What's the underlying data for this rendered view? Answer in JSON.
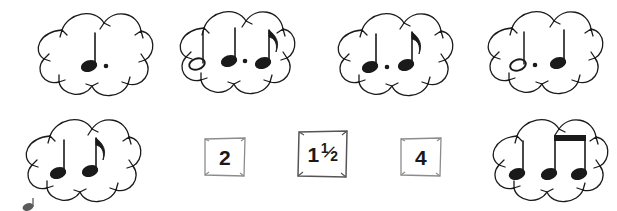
{
  "page": {
    "background_color": "#ffffff",
    "ink_color": "#1a1a1a",
    "box_border_color": "#8c8c8c"
  },
  "note_groups": [
    {
      "id": "group-1",
      "position": "top-row-1",
      "notes": [
        {
          "type": "quarter-note",
          "head": "filled",
          "stem": "up",
          "dotted": true,
          "flag": "none",
          "beamed": false
        }
      ],
      "note_count": 1,
      "beats": 1.5
    },
    {
      "id": "group-2",
      "position": "top-row-2",
      "notes": [
        {
          "type": "half-note",
          "head": "hollow",
          "stem": "up",
          "dotted": false,
          "flag": "none",
          "beamed": false
        },
        {
          "type": "quarter-note",
          "head": "filled",
          "stem": "up",
          "dotted": true,
          "flag": "none",
          "beamed": false
        },
        {
          "type": "eighth-note",
          "head": "filled",
          "stem": "up",
          "dotted": false,
          "flag": "single",
          "beamed": false
        }
      ],
      "note_count": 3,
      "beats": 4
    },
    {
      "id": "group-3",
      "position": "top-row-3",
      "notes": [
        {
          "type": "quarter-note",
          "head": "filled",
          "stem": "up",
          "dotted": true,
          "flag": "none",
          "beamed": false
        },
        {
          "type": "eighth-note",
          "head": "filled",
          "stem": "up",
          "dotted": false,
          "flag": "single",
          "beamed": false
        }
      ],
      "note_count": 2,
      "beats": 2
    },
    {
      "id": "group-4",
      "position": "top-row-4",
      "notes": [
        {
          "type": "half-note",
          "head": "hollow",
          "stem": "up",
          "dotted": true,
          "flag": "none",
          "beamed": false
        },
        {
          "type": "quarter-note",
          "head": "filled",
          "stem": "up",
          "dotted": false,
          "flag": "none",
          "beamed": false
        }
      ],
      "note_count": 2,
      "beats": 4
    },
    {
      "id": "group-5",
      "position": "bottom-row-1",
      "notes": [
        {
          "type": "quarter-note",
          "head": "filled",
          "stem": "up",
          "dotted": false,
          "flag": "none",
          "beamed": false
        },
        {
          "type": "eighth-note",
          "head": "filled",
          "stem": "up",
          "dotted": false,
          "flag": "single",
          "beamed": false
        }
      ],
      "note_count": 2,
      "beats": 1.5
    },
    {
      "id": "group-6",
      "position": "bottom-row-2",
      "notes": [
        {
          "type": "quarter-note",
          "head": "filled",
          "stem": "up",
          "dotted": false,
          "flag": "none",
          "beamed": false
        },
        {
          "type": "eighth-note",
          "head": "filled",
          "stem": "up",
          "dotted": false,
          "flag": "none",
          "beamed": true
        },
        {
          "type": "eighth-note",
          "head": "filled",
          "stem": "up",
          "dotted": false,
          "flag": "none",
          "beamed": true
        }
      ],
      "note_count": 3,
      "beats": 2
    }
  ],
  "value_boxes": [
    {
      "id": "box-2",
      "label": "2",
      "kind": "whole",
      "whole": "2",
      "numerator": "",
      "denominator": "",
      "size": "small"
    },
    {
      "id": "box-1-and-a-half",
      "label": "1½",
      "kind": "mixed",
      "whole": "1",
      "numerator": "1",
      "denominator": "2",
      "size": "large"
    },
    {
      "id": "box-4",
      "label": "4",
      "kind": "whole",
      "whole": "4",
      "numerator": "",
      "denominator": "",
      "size": "small"
    }
  ]
}
